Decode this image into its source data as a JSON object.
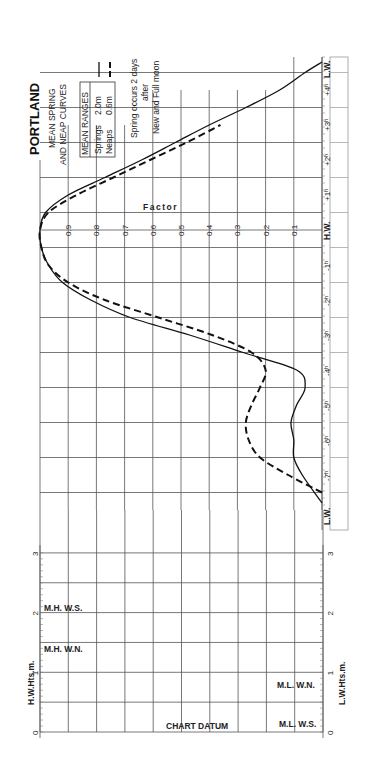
{
  "chart_data": {
    "type": "line",
    "orientation": "rotated-90",
    "title": "PORTLAND",
    "subtitle": [
      "MEAN SPRING",
      "AND NEAP CURVES"
    ],
    "legend": {
      "header": "MEAN RANGES",
      "entries": [
        {
          "name": "Springs",
          "value": "2.0m",
          "style": "solid"
        },
        {
          "name": "Neaps",
          "value": "0.6m",
          "style": "dashed"
        }
      ]
    },
    "note": [
      "Spring occurs 2 days",
      "after",
      "New and Full moon"
    ],
    "factor_axis": {
      "label": "Factor",
      "ticks": [
        "0.9",
        "0.8",
        "0.7",
        "0.6",
        "0.5",
        "0.4",
        "0.3",
        "0.2",
        "0.1"
      ],
      "range": [
        0,
        1
      ]
    },
    "time_axis": {
      "ticks": [
        "L.W.",
        "-7h",
        "-6h",
        "-5h",
        "-4h",
        "-3h",
        "-2h",
        "-1h",
        "H.W.",
        "+1h",
        "+2h",
        "+3h",
        "+4h",
        "L.W."
      ],
      "display": [
        "L.W.",
        "-7ʰ",
        "-6ʰ",
        "-5ʰ",
        "-4ʰ",
        "-3ʰ",
        "-2ʰ",
        "-1ʰ",
        "H.W.",
        "+1ʰ",
        "+2ʰ",
        "+3ʰ",
        "+4ʰ",
        "L.W."
      ]
    },
    "series": [
      {
        "name": "Springs",
        "style": "solid",
        "x_hours": [
          -7.8,
          -7.0,
          -6.5,
          -6.0,
          -5.5,
          -5.0,
          -4.5,
          -4.0,
          -3.5,
          -3.0,
          -2.5,
          -2.0,
          -1.5,
          -1.0,
          -0.5,
          0,
          0.5,
          1.0,
          1.5,
          2.0,
          2.5,
          3.0,
          3.5,
          4.0,
          4.5,
          4.8
        ],
        "factor": [
          0.0,
          0.07,
          0.1,
          0.1,
          0.11,
          0.09,
          0.06,
          0.09,
          0.28,
          0.47,
          0.68,
          0.82,
          0.92,
          0.97,
          0.995,
          1.0,
          0.98,
          0.9,
          0.77,
          0.64,
          0.52,
          0.4,
          0.27,
          0.15,
          0.06,
          0.0
        ]
      },
      {
        "name": "Neaps",
        "style": "dashed",
        "x_hours": [
          -7.5,
          -7.0,
          -6.5,
          -6.0,
          -5.5,
          -5.0,
          -4.5,
          -4.0,
          -3.5,
          -3.0,
          -2.5,
          -2.0,
          -1.5,
          -1.0,
          -0.5,
          0,
          0.5,
          1.0,
          1.5,
          2.0,
          2.5,
          3.0
        ],
        "factor": [
          0.0,
          0.12,
          0.22,
          0.26,
          0.27,
          0.25,
          0.22,
          0.2,
          0.25,
          0.39,
          0.58,
          0.77,
          0.9,
          0.97,
          0.995,
          1.0,
          0.97,
          0.87,
          0.74,
          0.61,
          0.48,
          0.36
        ]
      }
    ],
    "height_scale": {
      "left_label": "H.W.Hts.m.",
      "right_label": "L.W.Hts.m.",
      "ticks": [
        "0",
        "1",
        "2",
        "3"
      ],
      "annotations": {
        "mhws": "M.H. W.S.",
        "mhwn": "M.H. W.N.",
        "mlwn": "M.L. W.N.",
        "mlws": "M.L. W.S.",
        "datum": "CHART DATUM"
      }
    },
    "grid": true
  }
}
